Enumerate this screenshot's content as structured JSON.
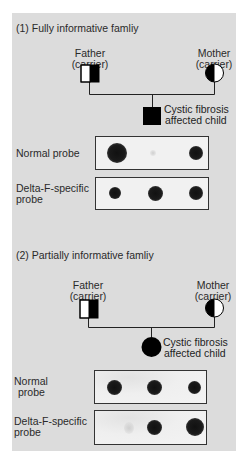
{
  "sections": [
    {
      "title": "(1) Fully informative famliy",
      "father": {
        "name": "Father",
        "status": "(carrier)",
        "symbol": "square-half-filled-right"
      },
      "mother": {
        "name": "Mother",
        "status": "(carrier)",
        "symbol": "circle-half-filled-left"
      },
      "child": {
        "line1": "Cystic fibrosis",
        "line2": "affected child",
        "symbol": "square-filled"
      },
      "probes": [
        {
          "label_line1": "Normal probe",
          "label_line2": "",
          "dots": [
            "strong",
            "faint-trace",
            "medium"
          ]
        },
        {
          "label_line1": "Delta-F-specific",
          "label_line2": "probe",
          "dots": [
            "medium",
            "strong",
            "medium"
          ]
        }
      ]
    },
    {
      "title": "(2) Partially informative famliy",
      "father": {
        "name": "Father",
        "status": "(carrier)",
        "symbol": "square-half-filled-right"
      },
      "mother": {
        "name": "Mother",
        "status": "(carrier)",
        "symbol": "circle-half-filled-left"
      },
      "child": {
        "line1": "Cystic fibrosis",
        "line2": "affected child",
        "symbol": "circle-filled"
      },
      "probes": [
        {
          "label_line1": "Normal",
          "label_line2": "probe",
          "dots": [
            "strong",
            "strong",
            "medium"
          ]
        },
        {
          "label_line1": "Delta-F-specific",
          "label_line2": "probe",
          "dots": [
            "faint-trace",
            "strong",
            "strong"
          ]
        }
      ]
    }
  ],
  "colors": {
    "panel_background": "#dcdcdc",
    "blot_background": "#f1f1f1",
    "symbol_fill": "#000000"
  }
}
